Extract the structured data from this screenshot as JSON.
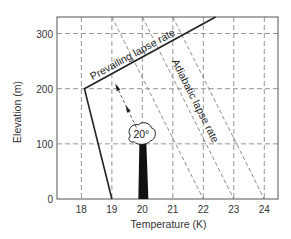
{
  "chart_data": {
    "type": "line",
    "title": "",
    "xlabel": "Temperature (K)",
    "ylabel": "Elevation (m)",
    "xlim": [
      17.2,
      24.45
    ],
    "ylim": [
      0,
      330
    ],
    "x_ticks": [
      18,
      19,
      20,
      21,
      22,
      23,
      24
    ],
    "x_tick_labels": [
      "18",
      "19",
      "20",
      "21",
      "22",
      "23",
      "24"
    ],
    "y_ticks": [
      0,
      100,
      200,
      300
    ],
    "y_tick_labels": [
      "0",
      "100",
      "200",
      "300"
    ],
    "grid": true,
    "series": [
      {
        "name": "Prevailing lapse rate",
        "style": "solid",
        "points": [
          [
            19.0,
            0
          ],
          [
            18.1,
            200
          ],
          [
            22.4,
            330
          ]
        ]
      },
      {
        "name": "Adiabatic lapse rate",
        "style": "dashed",
        "lines": [
          {
            "points": [
              [
                19.0,
                330
              ],
              [
                22.0,
                0
              ]
            ]
          },
          {
            "points": [
              [
                20.0,
                330
              ],
              [
                23.0,
                0
              ]
            ]
          },
          {
            "points": [
              [
                21.0,
                330
              ],
              [
                24.0,
                0
              ]
            ]
          }
        ]
      },
      {
        "name": "Parcel path",
        "style": "dashed-arrow",
        "points": [
          [
            20.0,
            115
          ],
          [
            19.15,
            205
          ]
        ]
      }
    ],
    "annotations": [
      {
        "text": "Prevailing lapse rate",
        "near": "upper-left segment of prevailing line"
      },
      {
        "text": "Adiabatic lapse rate",
        "near": "along middle adiabat"
      },
      {
        "text": "20°",
        "near": "cloud at top of plume"
      }
    ],
    "plume": {
      "temperature": 20,
      "top_elevation": 100,
      "label": "20°"
    }
  }
}
